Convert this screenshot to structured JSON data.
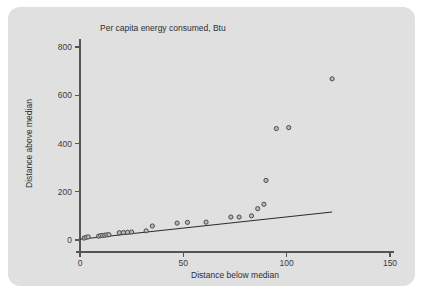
{
  "figure": {
    "panel_background": "#e0e0e0",
    "page_background": "#ffffff"
  },
  "chart_data": {
    "type": "scatter",
    "title": "Per capita energy consumed, Btu",
    "xlabel": "Distance below median",
    "ylabel": "Distance above median",
    "xlim": [
      0,
      150
    ],
    "ylim": [
      0,
      860
    ],
    "xticks": [
      0,
      50,
      100,
      150
    ],
    "yticks": [
      0,
      200,
      400,
      600,
      800
    ],
    "xtick_labels": [
      "0",
      "50",
      "100",
      "150"
    ],
    "ytick_labels": [
      "0",
      "200",
      "400",
      "600",
      "800"
    ],
    "grid": false,
    "legend": false,
    "marker": {
      "shape": "circle",
      "fill_color": "#b9b9bb",
      "edge_color": "#4a4a50",
      "radius_px": 2.1
    },
    "points": [
      {
        "x": 2,
        "y": 8
      },
      {
        "x": 3,
        "y": 11
      },
      {
        "x": 4,
        "y": 13
      },
      {
        "x": 9,
        "y": 16
      },
      {
        "x": 10,
        "y": 18
      },
      {
        "x": 11,
        "y": 19
      },
      {
        "x": 12,
        "y": 20
      },
      {
        "x": 13,
        "y": 21
      },
      {
        "x": 14,
        "y": 22
      },
      {
        "x": 19,
        "y": 30
      },
      {
        "x": 21,
        "y": 31
      },
      {
        "x": 23,
        "y": 32
      },
      {
        "x": 25,
        "y": 33
      },
      {
        "x": 32,
        "y": 38
      },
      {
        "x": 35,
        "y": 58
      },
      {
        "x": 47,
        "y": 70
      },
      {
        "x": 52,
        "y": 73
      },
      {
        "x": 61,
        "y": 74
      },
      {
        "x": 73,
        "y": 95
      },
      {
        "x": 77,
        "y": 95
      },
      {
        "x": 83,
        "y": 100
      },
      {
        "x": 86,
        "y": 130
      },
      {
        "x": 89,
        "y": 148
      },
      {
        "x": 90,
        "y": 247
      },
      {
        "x": 95,
        "y": 462
      },
      {
        "x": 101,
        "y": 466
      },
      {
        "x": 122,
        "y": 668
      }
    ],
    "fit_line": {
      "name": "reference line",
      "color": "#2b2b30",
      "x_start": 0,
      "y_start": 3,
      "x_end": 122,
      "y_end": 116
    }
  }
}
